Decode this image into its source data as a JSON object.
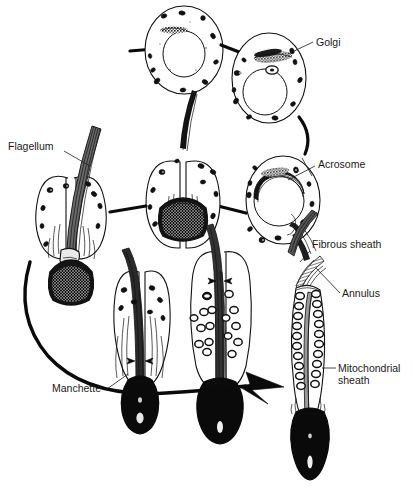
{
  "figure": {
    "background_color": "#ffffff",
    "ink_color": "#111111",
    "width": 413,
    "height": 499
  },
  "labels": [
    {
      "id": "golgi",
      "text": "Golgi",
      "x": 316,
      "y": 46,
      "anchor": "start"
    },
    {
      "id": "flagellum",
      "text": "Flagellum",
      "x": 8,
      "y": 150,
      "anchor": "start"
    },
    {
      "id": "acrosome",
      "text": "Acrosome",
      "x": 318,
      "y": 168,
      "anchor": "start"
    },
    {
      "id": "fibrous",
      "text": "Fibrous sheath",
      "x": 312,
      "y": 248,
      "anchor": "start"
    },
    {
      "id": "annulus",
      "text": "Annulus",
      "x": 342,
      "y": 297,
      "anchor": "start"
    },
    {
      "id": "mitochondrial",
      "text": "Mitochondrial",
      "x": 338,
      "y": 372,
      "anchor": "start"
    },
    {
      "id": "sheath",
      "text": "sheath",
      "x": 338,
      "y": 384,
      "anchor": "start"
    },
    {
      "id": "manchette",
      "text": "Manchette",
      "x": 52,
      "y": 392,
      "anchor": "start"
    }
  ],
  "stages": [
    {
      "id": "stage-1-round-spermatid",
      "name": "Round spermatid",
      "order": 1,
      "features": [
        "nucleus",
        "mitochondria",
        "golgi"
      ]
    },
    {
      "id": "stage-2-golgi-phase",
      "name": "Golgi phase spermatid",
      "order": 2,
      "features": [
        "golgi",
        "acrosomal-vesicle",
        "nucleus",
        "mitochondria"
      ]
    },
    {
      "id": "stage-3-cap-phase",
      "name": "Cap phase spermatid",
      "order": 3,
      "features": [
        "acrosome",
        "nucleus",
        "flagellum",
        "mitochondria"
      ]
    },
    {
      "id": "stage-4-acrosome-phase",
      "name": "Acrosome phase spermatid",
      "order": 4,
      "features": [
        "acrosome",
        "condensing-nucleus",
        "flagellum",
        "manchette"
      ]
    },
    {
      "id": "stage-5-early-elongation",
      "name": "Early elongating spermatid",
      "order": 5,
      "features": [
        "condensing-nucleus",
        "flagellum",
        "manchette"
      ]
    },
    {
      "id": "stage-6-manchette-spermatid",
      "name": "Manchette spermatid",
      "order": 6,
      "features": [
        "manchette",
        "condensed-nucleus",
        "flagellum"
      ]
    },
    {
      "id": "stage-7-mitochondria-migration",
      "name": "Mitochondrial migration stage",
      "order": 7,
      "features": [
        "mitochondria",
        "flagellum",
        "condensed-nucleus"
      ]
    },
    {
      "id": "stage-8-mature-spermatozoon",
      "name": "Mature spermatozoon",
      "order": 8,
      "features": [
        "mitochondrial-sheath",
        "annulus",
        "fibrous-sheath",
        "condensed-nucleus"
      ]
    }
  ],
  "caption": {
    "partial_text": ""
  }
}
